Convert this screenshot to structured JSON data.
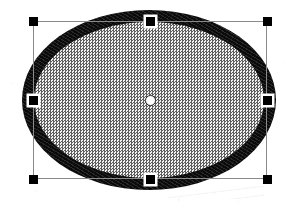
{
  "app": {
    "canvas_label": "Drawing canvas",
    "background_color": "#ffffff"
  },
  "shape": {
    "type": "ellipse",
    "name": "Ellipse",
    "state": "selected",
    "fill_pattern": "50% dithered gray halftone",
    "fill_color": "#9a9a9a",
    "stroke_color": "#0b0b0b",
    "stroke_width_px": 12,
    "bounds": {
      "x": 33,
      "y": 21,
      "width": 234,
      "height": 158
    }
  },
  "selection": {
    "box_color": "#8a8a8a",
    "handle_color": "#000000",
    "handle_ring_color": "#ffffff",
    "handle_size_px": 9,
    "handles": [
      {
        "id": "top-left",
        "name": "resize-handle-top-left",
        "x": 33,
        "y": 21,
        "ringed": false
      },
      {
        "id": "top-center",
        "name": "resize-handle-top-center",
        "x": 150,
        "y": 21,
        "ringed": true
      },
      {
        "id": "top-right",
        "name": "resize-handle-top-right",
        "x": 267,
        "y": 21,
        "ringed": false
      },
      {
        "id": "middle-left",
        "name": "resize-handle-middle-left",
        "x": 33,
        "y": 100,
        "ringed": true
      },
      {
        "id": "middle-right",
        "name": "resize-handle-middle-right",
        "x": 267,
        "y": 100,
        "ringed": true
      },
      {
        "id": "bottom-left",
        "name": "resize-handle-bottom-left",
        "x": 33,
        "y": 179,
        "ringed": false
      },
      {
        "id": "bottom-center",
        "name": "resize-handle-bottom-center",
        "x": 150,
        "y": 179,
        "ringed": true
      },
      {
        "id": "bottom-right",
        "name": "resize-handle-bottom-right",
        "x": 267,
        "y": 179,
        "ringed": false
      }
    ],
    "center_point": {
      "name": "shape-center-marker",
      "x": 150,
      "y": 100,
      "fill_color": "#ffffff",
      "outline_color": "#2a2a2a"
    }
  }
}
